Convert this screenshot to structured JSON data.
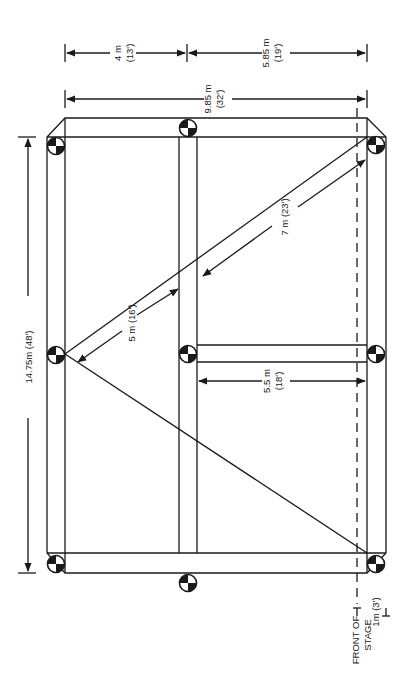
{
  "diagram": {
    "type": "stage truss rig plan",
    "dimensions": {
      "top_left_span": {
        "metric": "4 m",
        "imperial": "(13')"
      },
      "top_right_span": {
        "metric": "5.85 m",
        "imperial": "(19')"
      },
      "overall_width": {
        "metric": "9.85 m",
        "imperial": "(32')"
      },
      "overall_length": {
        "label": "14.75m (48')"
      },
      "diagonal_short": {
        "label": "5 m (16')"
      },
      "diagonal_long": {
        "label": "7 m (23')"
      },
      "cross_beam": {
        "metric": "5.5 m",
        "imperial": "(18')"
      },
      "front_offset": {
        "label": "1m (3')"
      }
    },
    "annotations": {
      "front_of_stage_line1": "FRONT OF",
      "front_of_stage_line2": "STAGE"
    },
    "hoist_points": 8,
    "colors": {
      "ink": "#1a1a1a",
      "background": "#ffffff"
    }
  }
}
